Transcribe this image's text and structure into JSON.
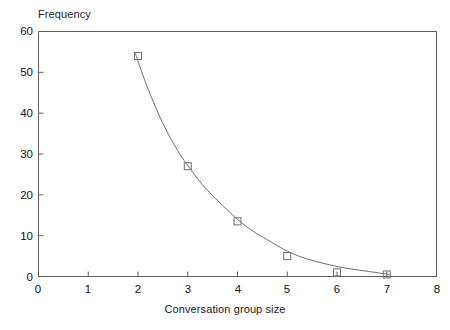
{
  "chart_data": {
    "type": "scatter",
    "title": "",
    "subtitle": "",
    "xlabel": "Conversation group size",
    "ylabel": "Frequency",
    "xlim": [
      0,
      8
    ],
    "ylim": [
      0,
      60
    ],
    "xticks": [
      "0",
      "1",
      "2",
      "3",
      "4",
      "5",
      "6",
      "7",
      "8"
    ],
    "yticks": [
      "0",
      "10",
      "20",
      "30",
      "40",
      "50",
      "60"
    ],
    "grid": false,
    "legend": null,
    "marker": "open-square",
    "x": [
      2,
      3,
      4,
      5,
      6,
      7
    ],
    "values": [
      54,
      27,
      13.5,
      5,
      1,
      0.5
    ],
    "points": [
      {
        "x": 2,
        "y": 54
      },
      {
        "x": 3,
        "y": 27
      },
      {
        "x": 4,
        "y": 13.5
      },
      {
        "x": 5,
        "y": 5
      },
      {
        "x": 6,
        "y": 1
      },
      {
        "x": 7,
        "y": 0.5
      }
    ],
    "series": [
      {
        "name": "Frequency",
        "style": "open-square markers with fitted exponential decay curve",
        "color": "#6f6f6f",
        "values": [
          54,
          27,
          13.5,
          5,
          1,
          0.5
        ]
      }
    ],
    "fit_curve": {
      "name": "exponential decay fit",
      "color": "#6f6f6f",
      "x": [
        1.95,
        2.2,
        2.5,
        2.8,
        3.0,
        3.3,
        3.6,
        4.0,
        4.3,
        4.6,
        5.0,
        5.4,
        5.8,
        6.2,
        6.6,
        7.0,
        7.05
      ],
      "y": [
        54.5,
        46.0,
        37.5,
        30.8,
        27.2,
        22.4,
        18.6,
        14.0,
        11.2,
        9.0,
        6.2,
        4.3,
        3.0,
        2.0,
        1.3,
        0.6,
        0.5
      ]
    }
  },
  "axes": {
    "y_title": "Frequency",
    "x_title": "Conversation group size"
  },
  "style": {
    "frame_color": "#5d5d5d",
    "curve_color": "#6f6f6f",
    "marker_edge_color": "#6f6f6f",
    "marker_fill": "none",
    "text_color": "#111111",
    "background": "#ffffff"
  }
}
